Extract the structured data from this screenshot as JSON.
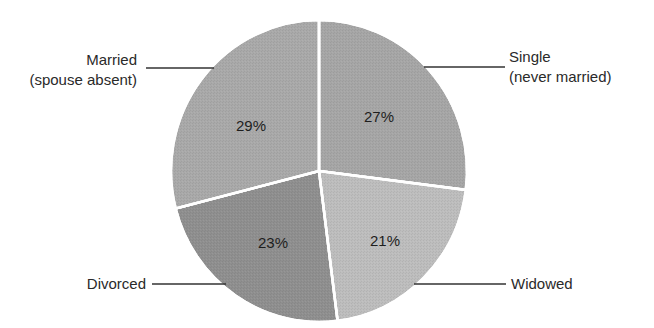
{
  "chart_data": {
    "type": "pie",
    "title": "",
    "categories": [
      "Single (never married)",
      "Widowed",
      "Divorced",
      "Married (spouse absent)"
    ],
    "values": [
      27,
      21,
      23,
      29
    ],
    "unit": "%",
    "start_angle": "12 o'clock, clockwise",
    "slices": [
      {
        "name": "Single",
        "sublabel": "(never married)",
        "value": 27,
        "label": "27%",
        "color": "#a6a6a6"
      },
      {
        "name": "Widowed",
        "sublabel": "",
        "value": 21,
        "label": "21%",
        "color": "#bdbdbd"
      },
      {
        "name": "Divorced",
        "sublabel": "",
        "value": 23,
        "label": "23%",
        "color": "#8f8f8f"
      },
      {
        "name": "Married",
        "sublabel": "(spouse absent)",
        "value": 29,
        "label": "29%",
        "color": "#a9a9a9"
      }
    ],
    "legend": "none (callout labels with leader lines)"
  },
  "labels": {
    "married_line1": "Married",
    "married_line2": "(spouse absent)",
    "single_line1": "Single",
    "single_line2": "(never married)",
    "divorced": "Divorced",
    "widowed": "Widowed"
  }
}
